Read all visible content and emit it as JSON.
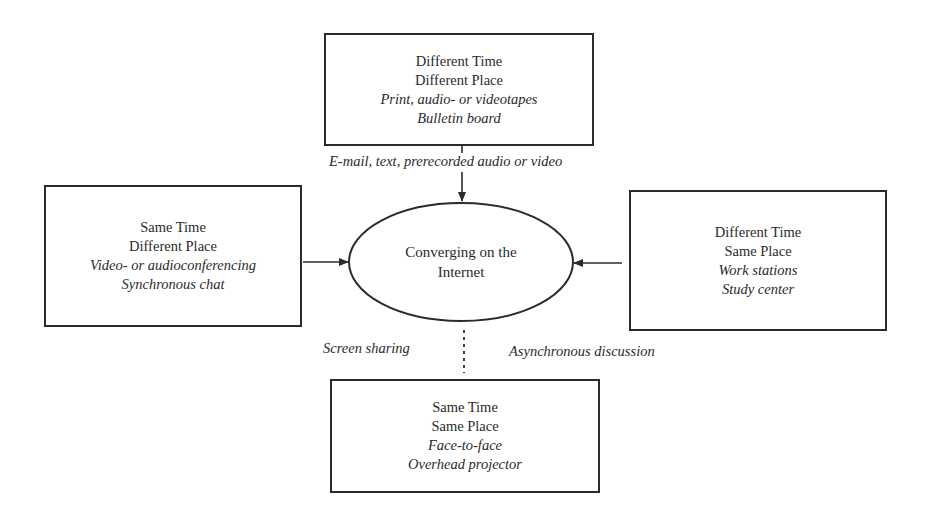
{
  "diagram": {
    "center": {
      "lines": [
        "Converging on the",
        "Internet"
      ]
    },
    "boxes": {
      "top": {
        "lines": [
          "Different Time",
          "Different Place"
        ],
        "examples": [
          "Print, audio- or videotapes",
          "Bulletin board"
        ]
      },
      "left": {
        "lines": [
          "Same Time",
          "Different Place"
        ],
        "examples": [
          "Video- or audioconferencing",
          "Synchronous chat"
        ]
      },
      "right": {
        "lines": [
          "Different Time",
          "Same Place"
        ],
        "examples": [
          "Work stations",
          "Study center"
        ]
      },
      "bottom": {
        "lines": [
          "Same Time",
          "Same Place"
        ],
        "examples": [
          "Face-to-face",
          "Overhead projector"
        ]
      }
    },
    "connector_labels": {
      "top": "E-mail, text, prerecorded audio or video",
      "bottom_left": "Screen sharing",
      "bottom_right": "Asynchronous discussion"
    },
    "colors": {
      "line": "#2b2b2b",
      "background": "#ffffff"
    }
  }
}
